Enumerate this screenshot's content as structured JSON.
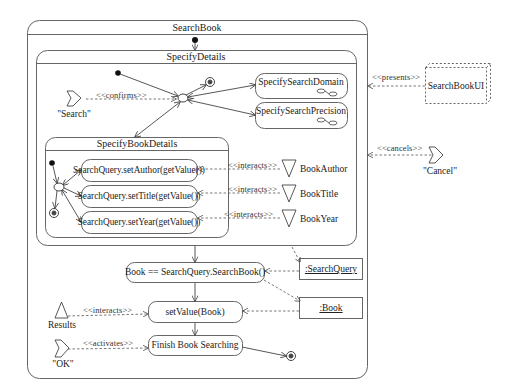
{
  "diagram": {
    "type": "UML activity diagram",
    "outer_state": {
      "name": "SearchBook"
    },
    "composite_states": [
      {
        "id": "specify_details",
        "name": "SpecifyDetails"
      },
      {
        "id": "specify_book_details",
        "name": "SpecifyBookDetails"
      }
    ],
    "sub_activities": [
      {
        "id": "domain",
        "name": "SpecifySearchDomain"
      },
      {
        "id": "precision",
        "name": "SpecifySearchPrecision"
      }
    ],
    "actions": [
      {
        "id": "set_author",
        "label": "SearchQuery.setAuthor(getValue())"
      },
      {
        "id": "set_title",
        "label": "SearchQuery.setTitle(getValue())"
      },
      {
        "id": "set_year",
        "label": "SearchQuery.setYear(getValue())"
      },
      {
        "id": "search_book",
        "label": "Book == SearchQuery.SearchBook()"
      },
      {
        "id": "set_value",
        "label": "setValue(Book)"
      },
      {
        "id": "finish",
        "label": "Finish Book Searching"
      }
    ],
    "objects": [
      {
        "id": "search_query",
        "label": ":SearchQuery"
      },
      {
        "id": "book",
        "label": ":Book"
      }
    ],
    "ui_element": {
      "name": "SearchBookUI"
    },
    "input_elements": [
      {
        "id": "book_author",
        "label": "BookAuthor"
      },
      {
        "id": "book_title",
        "label": "BookTitle"
      },
      {
        "id": "book_year",
        "label": "BookYear"
      }
    ],
    "output_element": {
      "label": "Results"
    },
    "events": [
      {
        "id": "search",
        "label": "\"Search\""
      },
      {
        "id": "cancel",
        "label": "\"Cancel\""
      },
      {
        "id": "ok",
        "label": "\"OK\""
      }
    ],
    "stereotypes": {
      "confirms": "<<confirms>>",
      "presents": "<<presents>>",
      "cancels": "<<cancels>>",
      "interacts_author": "<<interacts>>",
      "interacts_title": "<<interacts>>",
      "interacts_year": "<<interacts>>",
      "interacts_results": "<<interacts>>",
      "activates": "<<activates>>"
    },
    "colors": {
      "line": "#555555",
      "background": "#ffffff",
      "text": "#222222"
    }
  }
}
